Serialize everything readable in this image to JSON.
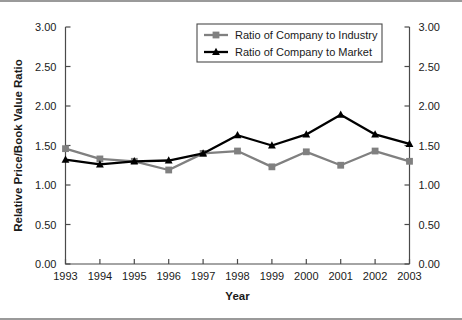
{
  "chart_data": {
    "type": "line",
    "title": "",
    "xlabel": "Year",
    "ylabel": "Relative Price/Book Value Ratio",
    "y2label": "",
    "x": [
      1993,
      1994,
      1995,
      1996,
      1997,
      1998,
      1999,
      2000,
      2001,
      2002,
      2003
    ],
    "xticklabels": [
      "1993",
      "1994",
      "1995",
      "1996",
      "1997",
      "1998",
      "1999",
      "2000",
      "2001",
      "2002",
      "2003"
    ],
    "xlim": [
      1993,
      2003
    ],
    "ylim": [
      0.0,
      3.0
    ],
    "yticks": [
      0.0,
      0.5,
      1.0,
      1.5,
      2.0,
      2.5,
      3.0
    ],
    "yticklabels": [
      "0.00",
      "0.50",
      "1.00",
      "1.50",
      "2.00",
      "2.50",
      "3.00"
    ],
    "y2ticklabels": [
      "0.00",
      "0.50",
      "1.00",
      "1.50",
      "2.00",
      "2.50",
      "3.00"
    ],
    "grid": false,
    "legend_position": "top-center",
    "series": [
      {
        "name": "Ratio of Company to Industry",
        "color": "#808080",
        "marker": "square",
        "values": [
          1.46,
          1.33,
          1.3,
          1.19,
          1.4,
          1.43,
          1.23,
          1.42,
          1.25,
          1.43,
          1.3
        ]
      },
      {
        "name": "Ratio of Company to Market",
        "color": "#000000",
        "marker": "triangle",
        "values": [
          1.32,
          1.26,
          1.3,
          1.31,
          1.4,
          1.63,
          1.5,
          1.64,
          1.89,
          1.64,
          1.52
        ]
      }
    ]
  },
  "colors": {
    "axis": "#4a4a4a",
    "text": "#1a1a1a",
    "frame": "#9a9a9a",
    "background": "#ffffff"
  }
}
